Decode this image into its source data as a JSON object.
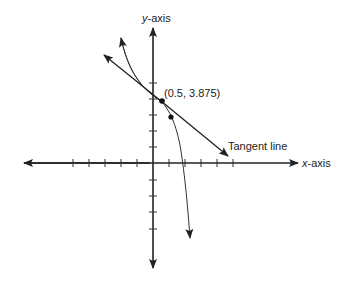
{
  "diagram": {
    "type": "function-with-tangent-line",
    "axes": {
      "x_label_var": "x",
      "x_label_suffix": "-axis",
      "y_label_var": "y",
      "y_label_suffix": "-axis",
      "ticks_left": 5,
      "ticks_right": 5,
      "ticks_up": 5,
      "ticks_down": 4
    },
    "point_label": "(0.5, 3.875)",
    "point": {
      "x": 0.5,
      "y": 3.875
    },
    "tangent_label": "Tangent line",
    "colors": {
      "stroke": "#222222",
      "background": "#ffffff"
    }
  }
}
